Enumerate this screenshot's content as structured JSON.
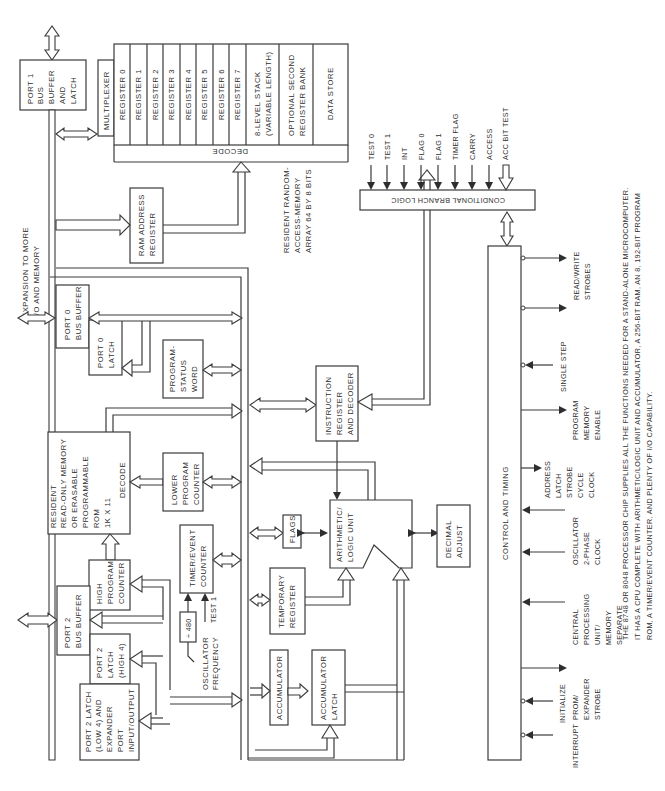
{
  "diagram": {
    "orientation": "rotated 90 degrees counter-clockwise",
    "blocks": {
      "port1": [
        "PORT 1",
        "BUS",
        "BUFFER",
        "AND",
        "LATCH"
      ],
      "multiplexer": "MULTIPLEXER",
      "registers": [
        "REGISTER 0",
        "REGISTER 1",
        "REGISTER 2",
        "REGISTER 3",
        "REGISTER 4",
        "REGISTER 5",
        "REGISTER 6",
        "REGISTER 7"
      ],
      "stack": [
        "8-LEVEL STACK",
        "(VARIABLE LENGTH)"
      ],
      "second_bank": [
        "OPTIONAL SECOND",
        "REGISTER BANK"
      ],
      "data_store": "DATA STORE",
      "ram_decode": "DECODE",
      "ram_caption": [
        "RESIDENT RANDOM-",
        "ACCESS-MEMORY",
        "ARRAY 64 BY 8 BITS"
      ],
      "ram_address": [
        "RAM ADDRESS",
        "REGISTER"
      ],
      "expansion": [
        "EXPANSION TO MORE",
        "I/O AND MEMORY"
      ],
      "port0_buffer": [
        "PORT 0",
        "BUS BUFFER"
      ],
      "port0_latch": [
        "PORT 0",
        "LATCH"
      ],
      "psw": [
        "PROGRAM-",
        "STATUS",
        "WORD"
      ],
      "rom": [
        "RESIDENT",
        "READ-ONLY MEMORY",
        "OR ERASABLE",
        "PROGRAMMABLE",
        "ROM",
        "1K X 11"
      ],
      "rom_decode": "DECODE",
      "lower_pc": [
        "LOWER",
        "PROGRAM",
        "COUNTER"
      ],
      "high_pc": [
        "HIGH",
        "PROGRAM",
        "COUNTER"
      ],
      "timer": [
        "TIMER/EVENT",
        "COUNTER"
      ],
      "divider": "÷ 480",
      "test1_input": "TEST 1",
      "osc_freq": [
        "OSCILLATOR",
        "FREQUENCY"
      ],
      "port2_buffer": [
        "PORT 2",
        "BUS BUFFER"
      ],
      "port2_latch_high": [
        "PORT 2",
        "LATCH",
        "(HIGH 4)"
      ],
      "port2_latch_low": [
        "PORT 2 LATCH",
        "(LOW 4) AND",
        "EXPANDER",
        "PORT",
        "INPUT/OUTPUT"
      ],
      "instruction": [
        "INSTRUCTION",
        "REGISTER",
        "AND DECODER"
      ],
      "flags": "FLAGS",
      "alu": [
        "ARITHMETIC/",
        "LOGIC UNIT"
      ],
      "decimal_adjust": [
        "DECIMAL",
        "ADJUST"
      ],
      "temp_register": [
        "TEMPORARY",
        "REGISTER"
      ],
      "accumulator": "ACCUMULATOR",
      "accumulator_latch": [
        "ACCUMULATOR",
        "LATCH"
      ],
      "branch_logic": "CONDITIONAL BRANCH LOGIC",
      "control_timing": "CONTROL AND TIMING"
    },
    "branch_inputs": [
      "TEST 0",
      "TEST 1",
      "INT",
      "FLAG 0",
      "FLAG 1",
      "TIMER FLAG",
      "CARRY",
      "ACCESS",
      "ACC BIT TEST"
    ],
    "control_signals": {
      "read_write": [
        "READ/WRITE",
        "STROBES"
      ],
      "single_step": "SINGLE STEP",
      "program_memory_enable": [
        "PROGRAM",
        "MEMORY",
        "ENABLE"
      ],
      "address_latch": [
        "ADDRESS",
        "LATCH",
        "STROBE",
        "CYCLE",
        "CLOCK"
      ],
      "oscillator": [
        "OSCILLATOR",
        "2-PHASE",
        "CLOCK"
      ],
      "cpu_memory": [
        "CENTRAL",
        "PROCESSING",
        "UNIT/",
        "MEMORY",
        "SEPARATE"
      ],
      "prom_expander": [
        "PROM/",
        "EXPANDER",
        "STROBE"
      ],
      "initialize": "INITIALIZE",
      "interrupt": "INTERRUPT"
    },
    "caption": [
      "THE 8748 OR 8048 PROCESSOR CHIP SUPPLIES ALL THE FUNCTIONS NEEDED FOR A STAND-ALONE MICROCOMPUTER.",
      "IT HAS A CPU COMPLETE WITH ARITHMETIC/LOGIC UNIT AND ACCUMULATOR, A 256-BIT RAM, AN 8, 192-BIT PROGRAM",
      "ROM, A TIMER/EVENT COUNTER, AND PLENTY OF I/O CAPABILITY."
    ]
  }
}
